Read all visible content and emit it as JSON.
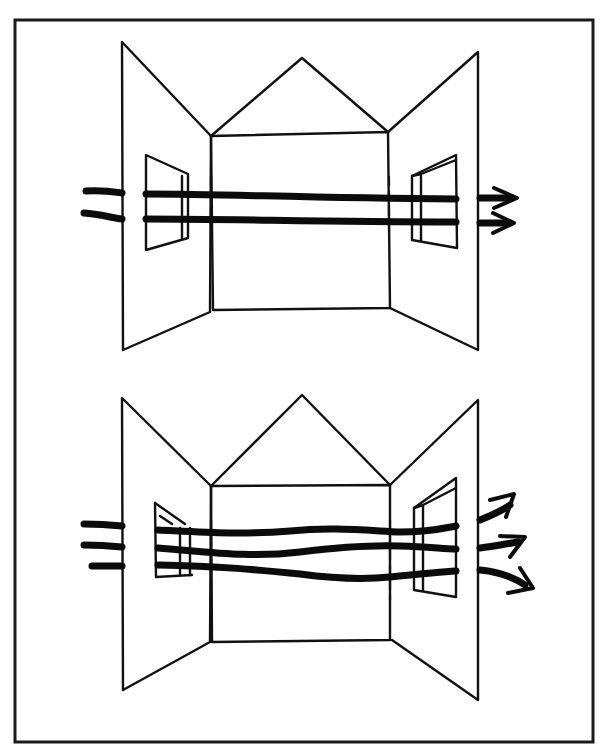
{
  "figure": {
    "colors": {
      "ink": "#111111",
      "paper": "#ffffff"
    },
    "frame": {
      "x": 15,
      "y": 20,
      "w": 578,
      "h": 722
    },
    "diagrams": [
      {
        "id": "top",
        "caption": "",
        "airflow_lines": 2,
        "airflow_style": "straight, parallel",
        "inlet_window": "left wall, small window",
        "outlet_window": "right wall, small window",
        "arrows": 2
      },
      {
        "id": "bottom",
        "caption": "",
        "airflow_lines": 3,
        "airflow_style": "wavy, diverging at outlet",
        "inlet_window": "left wall, window with angled sash",
        "outlet_window": "right wall, taller window",
        "arrows": 3
      }
    ]
  }
}
